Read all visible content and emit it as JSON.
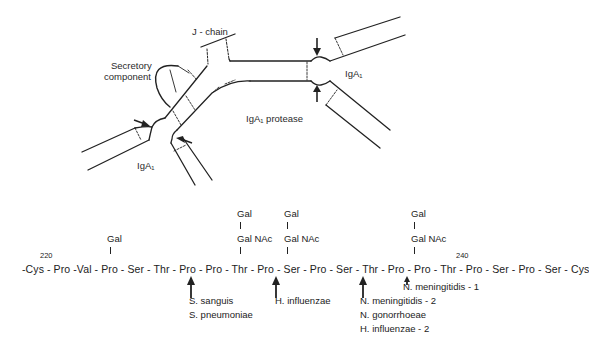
{
  "diagram": {
    "labels": {
      "j_chain": "J - chain",
      "secretory_component_line1": "Secretory",
      "secretory_component_line2": "component",
      "iga1_right": "IgA₁",
      "iga1_left": "IgA₁",
      "protease": "IgA₁ protease"
    },
    "sequence": {
      "start_number": "220",
      "end_number": "240",
      "text": "-Cys - Pro -Val - Pro - Ser - Thr - Pro - Pro - Thr - Pro - Ser - Pro - Ser - Thr - Pro - Pro - Thr - Pro - Ser - Pro - Ser  -  Cys",
      "residues": [
        "Cys",
        "Pro",
        "Val",
        "Pro",
        "Ser",
        "Thr",
        "Pro",
        "Pro",
        "Thr",
        "Pro",
        "Ser",
        "Pro",
        "Ser",
        "Thr",
        "Pro",
        "Pro",
        "Thr",
        "Pro",
        "Ser",
        "Pro",
        "Ser",
        "Cys"
      ]
    },
    "glycans": [
      {
        "position": "Ser (first)",
        "chain": [
          "Gal"
        ]
      },
      {
        "position": "Ser (second)",
        "chain": [
          "Gal",
          "Gal NAc"
        ]
      },
      {
        "position": "Ser (third)",
        "chain": [
          "Gal",
          "Gal NAc"
        ]
      },
      {
        "position": "Ser (fourth)",
        "chain": [
          "Gal",
          "Gal NAc"
        ]
      }
    ],
    "glycan_labels": {
      "g1_gal": "Gal",
      "g2_gal": "Gal",
      "g2_galnac": "Gal NAc",
      "g3_gal": "Gal",
      "g3_galnac": "Gal NAc",
      "g4_gal": "Gal",
      "g4_galnac": "Gal NAc"
    },
    "cleavage_sites": [
      {
        "site": "Pro-Thr",
        "organisms": [
          "S. sanguis",
          "S. pneumoniae"
        ]
      },
      {
        "site": "Pro-Ser",
        "organisms": [
          "H. influenzae"
        ]
      },
      {
        "site": "Pro-Thr",
        "organisms": [
          "N. meningitidis - 2",
          "N. gonorrhoeae",
          "H. influenzae - 2"
        ]
      },
      {
        "site": "Pro-Ser",
        "organisms": [
          "N. meningitidis - 1"
        ]
      }
    ],
    "organism_labels": {
      "s_sanguis": "S. sanguis",
      "s_pneumoniae": "S. pneumoniae",
      "h_influenzae": "H. influenzae",
      "n_meningitidis_2": "N. meningitidis - 2",
      "n_gonorrhoeae": "N. gonorrhoeae",
      "h_influenzae_2": "H. influenzae - 2",
      "n_meningitidis_1": "N. meningitidis - 1"
    }
  }
}
